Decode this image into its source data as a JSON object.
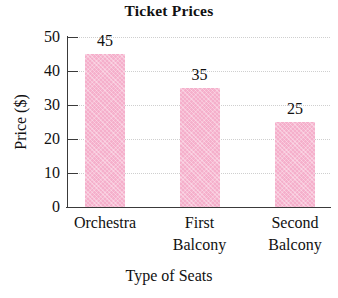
{
  "chart_data": {
    "type": "bar",
    "title": "Ticket Prices",
    "xlabel": "Type of Seats",
    "ylabel": "Price ($)",
    "categories": [
      "Orchestra",
      "First Balcony",
      "Second Balcony"
    ],
    "category_lines": [
      [
        "Orchestra"
      ],
      [
        "First",
        "Balcony"
      ],
      [
        "Second",
        "Balcony"
      ]
    ],
    "values": [
      45,
      35,
      25
    ],
    "value_labels": [
      "45",
      "35",
      "25"
    ],
    "ylim": [
      0,
      50
    ],
    "yticks": [
      0,
      10,
      20,
      30,
      40,
      50
    ],
    "ytick_labels": [
      "0",
      "10",
      "20",
      "30",
      "40",
      "50"
    ],
    "grid": true,
    "grid_axis": "y",
    "legend": false,
    "bar_color": "#f5afcb",
    "axis_color": "#3a3a3a",
    "grid_color": "#cfcfcf",
    "background_color": "#ffffff"
  }
}
